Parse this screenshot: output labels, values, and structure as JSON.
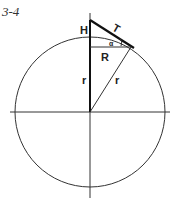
{
  "figure": {
    "number": "3-4",
    "labels": {
      "height": "H",
      "tangent": "T",
      "angle": "α",
      "horizontal_radius": "R",
      "vertical_radius": "r",
      "slant_radius": "r"
    },
    "bottom_caption_partial": "_ _"
  }
}
